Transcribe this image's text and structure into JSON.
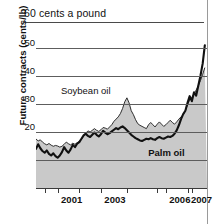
{
  "figure": {
    "title": "60 cents a pound",
    "ylabel": "Future contracts (cents/lb)"
  },
  "chart_data": {
    "type": "area",
    "title": "60 cents a pound",
    "xlabel": "",
    "ylabel": "Future contracts (cents/lb)",
    "units": "cents per pound",
    "xlim": [
      2000.0,
      2007.9
    ],
    "ylim": [
      0,
      55
    ],
    "yticks": [
      20,
      30,
      40,
      50
    ],
    "ytick_labels": [
      "20",
      "30",
      "40",
      "50"
    ],
    "gridlines": [
      10,
      20,
      30,
      40,
      50
    ],
    "grid": true,
    "legend": "inline-labels",
    "xticks": [
      2001,
      2003,
      2006,
      2007
    ],
    "xtick_labels": [
      "2001",
      "2003",
      "2006",
      "2007"
    ],
    "x": [
      2000.0,
      2000.1,
      2000.2,
      2000.3,
      2000.4,
      2000.5,
      2000.6,
      2000.7,
      2000.8,
      2000.9,
      2001.0,
      2001.1,
      2001.2,
      2001.3,
      2001.4,
      2001.5,
      2001.6,
      2001.7,
      2001.8,
      2001.9,
      2002.0,
      2002.1,
      2002.2,
      2002.3,
      2002.4,
      2002.5,
      2002.6,
      2002.7,
      2002.8,
      2002.9,
      2003.0,
      2003.1,
      2003.2,
      2003.3,
      2003.4,
      2003.5,
      2003.6,
      2003.7,
      2003.8,
      2003.9,
      2004.0,
      2004.1,
      2004.2,
      2004.3,
      2004.4,
      2004.5,
      2004.6,
      2004.7,
      2004.8,
      2004.9,
      2005.0,
      2005.1,
      2005.2,
      2005.3,
      2005.4,
      2005.5,
      2005.6,
      2005.7,
      2005.8,
      2005.9,
      2006.0,
      2006.1,
      2006.2,
      2006.3,
      2006.4,
      2006.5,
      2006.6,
      2006.7,
      2006.8,
      2006.9,
      2007.0,
      2007.1,
      2007.2,
      2007.3,
      2007.4,
      2007.5,
      2007.6,
      2007.7,
      2007.8
    ],
    "series": [
      {
        "name": "Soybean oil",
        "style": "thin-line-with-gray-fill",
        "color": "#c9c9c9",
        "values": [
          17.5,
          16.8,
          17.2,
          16.4,
          15.8,
          15.4,
          15.9,
          15.3,
          14.9,
          15.2,
          15.0,
          14.6,
          14.9,
          15.6,
          16.4,
          15.8,
          15.4,
          16.0,
          15.6,
          16.2,
          16.6,
          17.4,
          18.6,
          19.6,
          20.4,
          20.0,
          20.6,
          21.2,
          20.6,
          20.2,
          20.8,
          21.6,
          21.4,
          21.0,
          21.8,
          22.6,
          23.8,
          24.6,
          25.4,
          26.6,
          28.4,
          30.8,
          32.2,
          30.4,
          27.6,
          26.2,
          24.4,
          23.0,
          22.4,
          22.0,
          21.6,
          21.2,
          22.6,
          23.4,
          22.6,
          21.8,
          22.8,
          23.6,
          22.8,
          22.0,
          22.6,
          23.4,
          24.2,
          23.4,
          22.8,
          23.6,
          24.6,
          25.4,
          26.2,
          27.6,
          29.8,
          31.4,
          32.4,
          33.6,
          35.0,
          36.6,
          38.4,
          40.6,
          43.0
        ]
      },
      {
        "name": "Palm oil",
        "style": "bold-black-line",
        "color": "#111111",
        "values": [
          14.0,
          15.6,
          14.2,
          13.2,
          12.6,
          13.4,
          12.2,
          11.6,
          12.4,
          11.4,
          10.8,
          11.6,
          12.8,
          14.6,
          13.4,
          12.6,
          13.8,
          15.4,
          14.6,
          15.8,
          16.4,
          17.6,
          18.8,
          19.4,
          18.6,
          18.2,
          19.0,
          19.8,
          19.0,
          18.4,
          19.2,
          20.4,
          19.8,
          19.2,
          19.6,
          20.2,
          20.8,
          21.4,
          21.0,
          21.6,
          22.0,
          21.4,
          20.6,
          19.8,
          19.0,
          18.4,
          17.8,
          17.4,
          17.0,
          16.8,
          17.2,
          17.6,
          17.4,
          17.8,
          17.4,
          17.2,
          17.8,
          18.2,
          17.8,
          17.6,
          18.0,
          18.4,
          18.2,
          18.6,
          19.4,
          20.6,
          22.4,
          24.6,
          26.4,
          27.6,
          30.4,
          32.8,
          31.0,
          34.2,
          33.0,
          36.6,
          40.2,
          44.4,
          51.0
        ]
      }
    ],
    "annotations": [
      {
        "text": "Soybean oil",
        "x": 2003.0,
        "y": 34.5
      },
      {
        "text": "Palm oil",
        "x": 2006.2,
        "y": 12.5
      }
    ]
  }
}
